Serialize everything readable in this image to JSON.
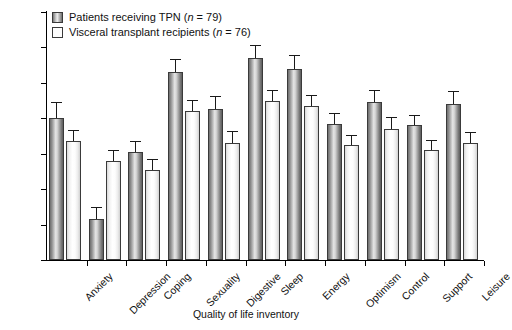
{
  "chart_data": {
    "type": "bar",
    "title": "",
    "xlabel": "Quality of life inventory",
    "ylabel": "Score",
    "ylim": [
      0,
      7
    ],
    "yticks": [
      0,
      1,
      2,
      3,
      4,
      5,
      6,
      7
    ],
    "grid": false,
    "legend_position": "top-left",
    "categories": [
      "Anxiety",
      "Depression",
      "Coping",
      "Sexuality",
      "Digestive",
      "Sleep",
      "Energy",
      "Optimism",
      "Control",
      "Support",
      "Leisure"
    ],
    "series": [
      {
        "name": "Patients receiving TPN (n = 79)",
        "values": [
          4.0,
          1.15,
          3.05,
          5.3,
          4.25,
          5.7,
          5.4,
          3.85,
          4.45,
          3.8,
          4.4
        ],
        "errors": [
          0.43,
          0.32,
          0.28,
          0.35,
          0.35,
          0.33,
          0.35,
          0.27,
          0.33,
          0.27,
          0.33
        ]
      },
      {
        "name": "Visceral transplant recipients (n = 76)",
        "values": [
          3.35,
          2.8,
          2.55,
          4.2,
          3.3,
          4.5,
          4.35,
          3.25,
          3.7,
          3.1,
          3.3
        ],
        "errors": [
          0.3,
          0.28,
          0.27,
          0.3,
          0.3,
          0.28,
          0.28,
          0.25,
          0.3,
          0.27,
          0.28
        ]
      }
    ],
    "ytick_labels": [
      "0",
      "1",
      "2",
      "3",
      "4",
      "5",
      "6",
      "7"
    ]
  },
  "legend": {
    "items": [
      {
        "label_a": "Patients receiving TPN (",
        "label_n": "n",
        "label_b": " = 79)",
        "swatch": "dark-striped-swatch"
      },
      {
        "label_a": "Visceral transplant recipients (",
        "label_n": "n",
        "label_b": " = 76)",
        "swatch": "light-swatch"
      }
    ]
  },
  "axes": {
    "y_title": "Score",
    "x_title": "Quality of life inventory"
  }
}
